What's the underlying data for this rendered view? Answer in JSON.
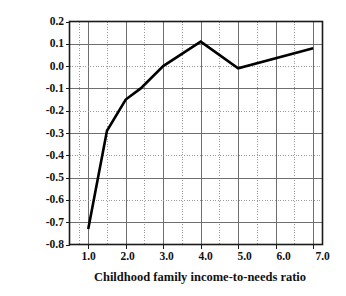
{
  "chart_data": {
    "type": "line",
    "title": "",
    "xlabel": "Childhood family income-to-needs ratio",
    "ylabel": "Log adult family income-to-needs ratio",
    "xlim": [
      0.5,
      7.25
    ],
    "ylim": [
      -0.8,
      0.2
    ],
    "grid": true,
    "grid_x_step": 0.5,
    "grid_y_step": 0.1,
    "legend": "none",
    "xticks": [
      "1.0",
      "2.0",
      "3.0",
      "4.0",
      "5.0",
      "6.0",
      "7.0"
    ],
    "xtick_values": [
      1.0,
      2.0,
      3.0,
      4.0,
      5.0,
      6.0,
      7.0
    ],
    "yticks": [
      "0.2",
      "0.1",
      "0.0",
      "-0.1",
      "-0.2",
      "-0.3",
      "-0.4",
      "-0.5",
      "-0.6",
      "-0.7",
      "-0.8"
    ],
    "ytick_values": [
      0.2,
      0.1,
      0.0,
      -0.1,
      -0.2,
      -0.3,
      -0.4,
      -0.5,
      -0.6,
      -0.7,
      -0.8
    ],
    "series": [
      {
        "name": "log adult family income-to-needs ratio",
        "color": "#000000",
        "linewidth": 2.6,
        "x": [
          1.0,
          1.5,
          2.0,
          2.4,
          3.0,
          4.0,
          5.0,
          7.0
        ],
        "y": [
          -0.73,
          -0.29,
          -0.15,
          -0.1,
          0.0,
          0.11,
          -0.01,
          0.08
        ]
      }
    ]
  },
  "colors": {
    "axis": "#1a1a1a",
    "grid_solid": "#6f6f6f",
    "grid_dotted": "#9a9a9a",
    "line": "#000000",
    "text": "#111111",
    "background": "#ffffff"
  }
}
